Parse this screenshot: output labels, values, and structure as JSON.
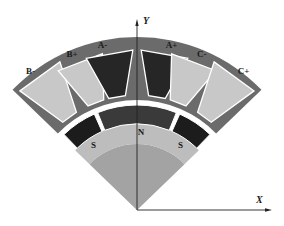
{
  "figure": {
    "type": "motor cross-section sector",
    "origin": {
      "x": 137,
      "y": 210
    },
    "sector_half_angle_deg": 46,
    "colors": {
      "background": "#ffffff",
      "stator": "#6b6b6b",
      "slot_dark": "#262626",
      "slot_light": "#c8c8c8",
      "slot_border": "#ffffff",
      "magnet": "#1c1c1c",
      "magnet_center": "#3a3a3a",
      "rotor_ring": "#bdbdbd",
      "rotor_core": "#a3a3a3",
      "axis": "#222222"
    },
    "radii": {
      "stator_outer": 173,
      "stator_inner": 110,
      "air_gap_inner": 106,
      "magnet_outer": 105,
      "magnet_inner": 86,
      "rotor_ring_inner": 66
    }
  },
  "axes": {
    "x_label": "X",
    "y_label": "Y"
  },
  "coils": [
    {
      "label": "B-",
      "angle_deg": -36,
      "fill": "light"
    },
    {
      "label": "B+",
      "angle_deg": -21,
      "fill": "light"
    },
    {
      "label": "A-",
      "angle_deg": -10,
      "fill": "dark"
    },
    {
      "label": "A+",
      "angle_deg": 10,
      "fill": "dark"
    },
    {
      "label": "C-",
      "angle_deg": 21,
      "fill": "light"
    },
    {
      "label": "C+",
      "angle_deg": 36,
      "fill": "light"
    }
  ],
  "magnets": [
    {
      "label": "S",
      "span_deg": [
        -44,
        -24
      ]
    },
    {
      "label": "N",
      "span_deg": [
        -22,
        22
      ]
    },
    {
      "label": "S",
      "span_deg": [
        24,
        44
      ]
    }
  ]
}
